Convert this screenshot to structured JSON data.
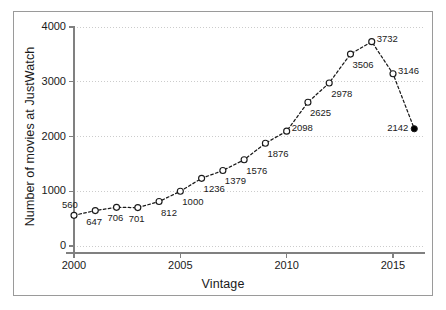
{
  "chart_data": {
    "type": "line",
    "title": "",
    "xlabel": "Vintage",
    "ylabel": "Number of movies at JustWatch",
    "xlim": [
      1999.4,
      2016.6
    ],
    "ylim": [
      0,
      4150
    ],
    "xticks": [
      2000,
      2005,
      2010,
      2015
    ],
    "yticks": [
      0,
      1000,
      2000,
      3000,
      4000
    ],
    "xtick_labels": [
      "2000",
      "2005",
      "2010",
      "2015"
    ],
    "ytick_labels": [
      "0",
      "1000",
      "2000",
      "3000",
      "4000"
    ],
    "grid": "horizontal-dotted",
    "legend": "none",
    "line_style": "dashed",
    "marker": "open-circle",
    "last_marker": "filled-circle",
    "x": [
      2000,
      2001,
      2002,
      2003,
      2004,
      2005,
      2006,
      2007,
      2008,
      2009,
      2010,
      2011,
      2012,
      2013,
      2014,
      2015,
      2016
    ],
    "values": [
      560,
      647,
      706,
      701,
      812,
      1000,
      1236,
      1379,
      1576,
      1876,
      2098,
      2625,
      2978,
      3506,
      3732,
      3146,
      2142
    ],
    "data_labels": [
      "560",
      "647",
      "706",
      "701",
      "812",
      "1000",
      "1236",
      "1379",
      "1576",
      "1876",
      "2098",
      "2625",
      "2978",
      "3506",
      "3732",
      "3146",
      "2142"
    ],
    "label_positions": [
      "above-left",
      "below",
      "below",
      "below",
      "below-right",
      "below-right",
      "below-right",
      "below-right",
      "below-right",
      "below-right",
      "right",
      "below-right",
      "below-right",
      "below-right",
      "right",
      "right",
      "left"
    ],
    "colors": {
      "line": "#1a1a1a",
      "marker_face": "#ffffff",
      "marker_edge": "#1a1a1a",
      "last_marker_face": "#000000",
      "grid": "#cccccc",
      "axis": "#808080",
      "text": "#1a1a1a",
      "frame": "#9a9a9a",
      "background": "#ffffff"
    }
  }
}
